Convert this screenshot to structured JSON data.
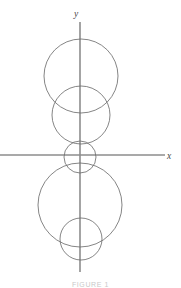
{
  "figure": {
    "caption": "FIGURE 1",
    "background_color": "#ffffff",
    "axis_color": "#8d8d8d",
    "curve_color": "#6f6f6f",
    "label_color": "#4a4a4a"
  },
  "axes": {
    "x_label": "x",
    "y_label": "y",
    "origin": {
      "x": 80,
      "y": 155
    },
    "x_axis": {
      "x1": 0,
      "y1": 155,
      "x2": 165,
      "y2": 155
    },
    "y_axis": {
      "x1": 80,
      "y1": 22,
      "x2": 80,
      "y2": 272
    }
  },
  "chart_data": {
    "type": "scatter",
    "title": "",
    "subtitle": "",
    "xlabel": "x",
    "ylabel": "y",
    "grid": false,
    "legend": "none",
    "axis_origin_px": {
      "x": 80,
      "y": 155
    },
    "xlim_px": [
      0,
      165
    ],
    "ylim_px": [
      22,
      272
    ],
    "series": [
      {
        "name": "circles",
        "shape": "circle",
        "units": "pixels",
        "points": [
          {
            "id": "circle-1",
            "cx": 81,
            "cy": 76,
            "r": 37
          },
          {
            "id": "circle-2",
            "cx": 81,
            "cy": 115,
            "r": 29
          },
          {
            "id": "circle-3",
            "cx": 80,
            "cy": 157,
            "r": 16
          },
          {
            "id": "circle-4",
            "cx": 80,
            "cy": 205,
            "r": 42
          },
          {
            "id": "circle-5",
            "cx": 81,
            "cy": 239,
            "r": 21
          }
        ]
      }
    ],
    "annotations": [
      {
        "text": "y",
        "x": 78,
        "y": 13,
        "style": "italic"
      },
      {
        "text": "x",
        "x": 168,
        "y": 157,
        "style": "italic"
      }
    ]
  }
}
